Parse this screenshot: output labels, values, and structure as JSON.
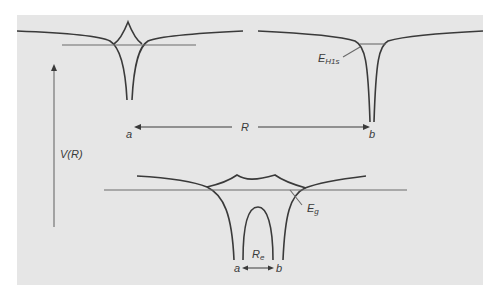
{
  "diagram": {
    "axis_label": "V(R)",
    "top": {
      "atom_a_label": "a",
      "atom_b_label": "b",
      "separation_label": "R",
      "level_label_main": "E",
      "level_label_sub": "H1s"
    },
    "bottom": {
      "atom_a_label": "a",
      "atom_b_label": "b",
      "separation_label_main": "R",
      "separation_label_sub": "e",
      "level_label_main": "E",
      "level_label_sub": "g"
    },
    "colors": {
      "background": "#e6e6e6",
      "curve": "#3a3a3a",
      "level_line": "#6a6a6a"
    }
  }
}
